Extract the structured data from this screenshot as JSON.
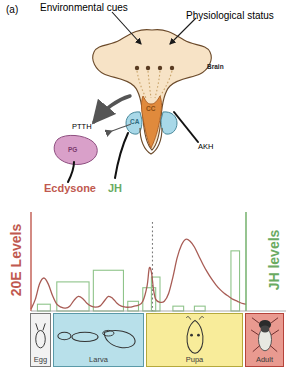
{
  "figure": {
    "panel_letter": "(a)",
    "top_labels": {
      "left": "Environmental cues",
      "right": "Physiological status"
    },
    "diagram": {
      "brain_label": "Brain",
      "organs": [
        {
          "id": "cc",
          "label": "CC",
          "color": "#e08a3c"
        },
        {
          "id": "ca",
          "label": "CA",
          "color": "#a8d8e8"
        },
        {
          "id": "pg",
          "label": "PG",
          "color": "#d9a0c9"
        }
      ],
      "brain_color": "#f7e3c6",
      "hormone_labels": [
        {
          "id": "ptth",
          "label": "PTTH"
        },
        {
          "id": "akh",
          "label": "AKH"
        }
      ]
    },
    "legend": [
      {
        "id": "ecdysone",
        "label": "Ecdysone",
        "color": "#c0594f"
      },
      {
        "id": "jh",
        "label": "JH",
        "color": "#6aab62"
      }
    ],
    "axes": {
      "left_label": "20E Levels",
      "left_color": "#c0594f",
      "right_label": "JH levels",
      "right_color": "#6aab62"
    },
    "stages": [
      {
        "id": "egg",
        "label": "Egg",
        "color": "#f2f2f2",
        "border": "#7a7a7a",
        "x": 30,
        "width": 23
      },
      {
        "id": "larva",
        "label": "Larva",
        "color": "#b8e0ea",
        "border": "#5a9aa8",
        "x": 53,
        "width": 93
      },
      {
        "id": "pupa",
        "label": "Pupa",
        "color": "#f8ec9a",
        "border": "#b5a93c",
        "x": 146,
        "width": 99
      },
      {
        "id": "adult",
        "label": "Adult",
        "color": "#e99a90",
        "border": "#b5433a",
        "x": 245,
        "width": 41
      }
    ]
  },
  "chart_data": {
    "type": "line",
    "xlabel": "",
    "ylabel": "20E Levels",
    "ylabel_right": "JH levels",
    "xlim": [
      0,
      100
    ],
    "ylim": [
      0,
      100
    ],
    "grid": false,
    "legend_position": "above-plot",
    "annotations": [
      {
        "type": "vline",
        "x": 56.5,
        "style": "dotted",
        "color": "#7a7a7a",
        "label": "pupariation"
      }
    ],
    "series": [
      {
        "name": "Ecdysone",
        "type": "line",
        "color": "#a85c55",
        "x": [
          0,
          2,
          4,
          6,
          8,
          10,
          12,
          14,
          16,
          18,
          20,
          22,
          24,
          26,
          28,
          30,
          32,
          34,
          36,
          38,
          40,
          42,
          44,
          46,
          48,
          50,
          52,
          54,
          55,
          56,
          57,
          58,
          60,
          62,
          64,
          66,
          68,
          70,
          72,
          74,
          76,
          78,
          80,
          82,
          84,
          86,
          88,
          90,
          92,
          94,
          96,
          98,
          100
        ],
        "y": [
          2,
          12,
          28,
          34,
          28,
          16,
          7,
          4,
          3,
          5,
          11,
          15,
          13,
          8,
          5,
          4,
          5,
          10,
          15,
          13,
          8,
          5,
          4,
          4,
          5,
          6,
          10,
          26,
          44,
          40,
          22,
          12,
          9,
          10,
          18,
          35,
          55,
          68,
          74,
          72,
          66,
          57,
          48,
          40,
          33,
          27,
          22,
          18,
          15,
          12,
          10,
          8,
          7
        ]
      },
      {
        "name": "JH",
        "type": "bar",
        "color": "#8fc48a",
        "fill": "none",
        "bars": [
          {
            "x": 3,
            "width": 6,
            "height": 7
          },
          {
            "x": 12,
            "width": 15,
            "height": 30
          },
          {
            "x": 29,
            "width": 14,
            "height": 42
          },
          {
            "x": 45,
            "width": 5,
            "height": 10
          },
          {
            "x": 52,
            "width": 6,
            "height": 24
          },
          {
            "x": 56,
            "width": 4,
            "height": 35
          },
          {
            "x": 66,
            "width": 5,
            "height": 5
          },
          {
            "x": 76,
            "width": 5,
            "height": 5
          },
          {
            "x": 93,
            "width": 4,
            "height": 62
          }
        ]
      }
    ]
  }
}
